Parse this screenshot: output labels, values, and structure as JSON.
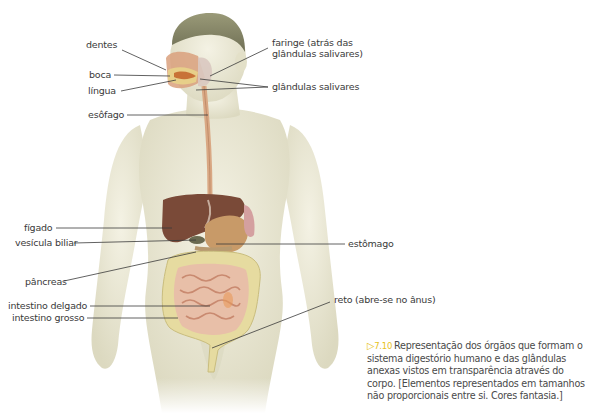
{
  "figure": {
    "title": "Sistema digestório humano",
    "labels": {
      "dentes": "dentes",
      "boca": "boca",
      "lingua": "língua",
      "esofago": "esôfago",
      "faringe_line1": "faringe (atrás das",
      "faringe_line2": "glândulas salivares)",
      "glandulas": "glândulas salivares",
      "figado": "fígado",
      "vesicula": "vesícula biliar",
      "estomago": "estômago",
      "pancreas": "pâncreas",
      "intestino_delgado": "intestino delgado",
      "intestino_grosso": "intestino grosso",
      "reto": "reto (abre-se no ânus)"
    },
    "colors": {
      "skin": "#efeedd",
      "skin_shadow": "#d8d5bc",
      "hair": "#8a8a6a",
      "liver": "#7a4a38",
      "stomach": "#c89a68",
      "large_intestine": "#e6dba0",
      "small_intestine": "#e8bfa8",
      "esophagus": "#d9a884",
      "leader_line": "#3a3a3a",
      "accent": "#e7c21b"
    }
  },
  "caption": {
    "marker": "▷",
    "number": "7.10",
    "text": "Representação dos órgãos que formam o sistema digestório humano e das glândulas anexas vistos em transparência através do corpo. [Elementos representados em tamanhos não proporcionais entre si. Cores fantasia.]"
  }
}
